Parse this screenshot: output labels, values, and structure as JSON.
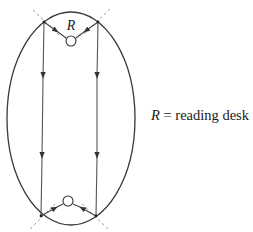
{
  "diagram": {
    "colors": {
      "ellipse": "#3a3a3a",
      "rays": "#444444",
      "dashed": "#9a9a9a",
      "text": "#1a1a1a"
    },
    "ellipse": {
      "cx": 71,
      "cy": 118.5,
      "rx": 64,
      "ry": 106.5
    },
    "focus_top": {
      "cx": 71,
      "cy": 41,
      "r": 5,
      "label": "R"
    },
    "focus_bottom": {
      "cx": 68,
      "cy": 201,
      "r": 5
    },
    "reflection_points": {
      "top_left": [
        44,
        22
      ],
      "top_right": [
        98,
        22
      ],
      "bottom_left": [
        41,
        216
      ],
      "bottom_right": [
        96,
        216
      ]
    }
  },
  "legend": {
    "symbol": "R",
    "equals": " = ",
    "text": "reading desk"
  }
}
